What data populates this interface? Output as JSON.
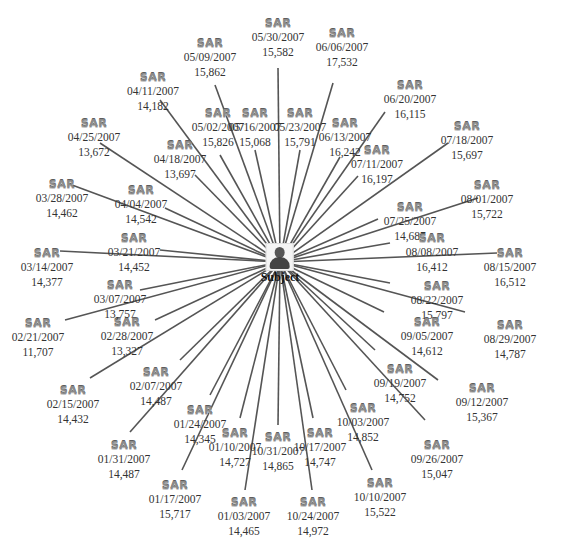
{
  "diagram": {
    "center": {
      "label": "Subject",
      "icon": "person-icon",
      "x": 280,
      "y": 262
    },
    "node_icon_label": "SAR",
    "line_color": "#555555",
    "nodes": [
      {
        "date": "05/30/2007",
        "amount": "15,582",
        "x": 278,
        "y": 18,
        "lx": 278,
        "ly": 68
      },
      {
        "date": "06/06/2007",
        "amount": "17,532",
        "x": 342,
        "y": 28,
        "lx": 333,
        "ly": 83
      },
      {
        "date": "06/20/2007",
        "amount": "16,115",
        "x": 410,
        "y": 80,
        "lx": 385,
        "ly": 112
      },
      {
        "date": "07/18/2007",
        "amount": "15,697",
        "x": 467,
        "y": 121,
        "lx": 448,
        "ly": 143
      },
      {
        "date": "08/01/2007",
        "amount": "15,722",
        "x": 487,
        "y": 180,
        "lx": 478,
        "ly": 198
      },
      {
        "date": "08/15/2007",
        "amount": "16,512",
        "x": 510,
        "y": 248,
        "lx": 497,
        "ly": 253
      },
      {
        "date": "08/29/2007",
        "amount": "14,787",
        "x": 510,
        "y": 320,
        "lx": 465,
        "ly": 312
      },
      {
        "date": "09/12/2007",
        "amount": "15,367",
        "x": 482,
        "y": 383,
        "lx": 438,
        "ly": 380
      },
      {
        "date": "09/26/2007",
        "amount": "15,047",
        "x": 437,
        "y": 440,
        "lx": 425,
        "ly": 420
      },
      {
        "date": "10/10/2007",
        "amount": "15,522",
        "x": 380,
        "y": 478,
        "lx": 372,
        "ly": 470
      },
      {
        "date": "10/24/2007",
        "amount": "14,972",
        "x": 313,
        "y": 497,
        "lx": 312,
        "ly": 490
      },
      {
        "date": "01/03/2007",
        "amount": "14,465",
        "x": 244,
        "y": 497,
        "lx": 245,
        "ly": 490
      },
      {
        "date": "01/17/2007",
        "amount": "15,717",
        "x": 175,
        "y": 480,
        "lx": 182,
        "ly": 470
      },
      {
        "date": "01/31/2007",
        "amount": "14,487",
        "x": 124,
        "y": 440,
        "lx": 130,
        "ly": 432
      },
      {
        "date": "02/15/2007",
        "amount": "14,432",
        "x": 73,
        "y": 385,
        "lx": 90,
        "ly": 378
      },
      {
        "date": "02/21/2007",
        "amount": "11,707",
        "x": 38,
        "y": 318,
        "lx": 65,
        "ly": 320
      },
      {
        "date": "03/14/2007",
        "amount": "14,377",
        "x": 47,
        "y": 248,
        "lx": 60,
        "ly": 251
      },
      {
        "date": "03/28/2007",
        "amount": "14,462",
        "x": 62,
        "y": 179,
        "lx": 72,
        "ly": 185
      },
      {
        "date": "04/25/2007",
        "amount": "13,672",
        "x": 94,
        "y": 118,
        "lx": 100,
        "ly": 143
      },
      {
        "date": "04/11/2007",
        "amount": "14,182",
        "x": 153,
        "y": 72,
        "lx": 160,
        "ly": 100
      },
      {
        "date": "05/09/2007",
        "amount": "15,862",
        "x": 210,
        "y": 38,
        "lx": 215,
        "ly": 85
      },
      {
        "date": "05/16/2007",
        "amount": "15,068",
        "x": 255,
        "y": 108,
        "lx": 255,
        "ly": 150
      },
      {
        "date": "05/23/2007",
        "amount": "15,791",
        "x": 300,
        "y": 108,
        "lx": 300,
        "ly": 150
      },
      {
        "date": "06/13/2007",
        "amount": "16,242",
        "x": 345,
        "y": 118,
        "lx": 340,
        "ly": 157
      },
      {
        "date": "07/11/2007",
        "amount": "16,197",
        "x": 377,
        "y": 145,
        "lx": 358,
        "ly": 176
      },
      {
        "date": "07/25/2007",
        "amount": "14,687",
        "x": 410,
        "y": 202,
        "lx": 378,
        "ly": 219
      },
      {
        "date": "08/08/2007",
        "amount": "16,412",
        "x": 432,
        "y": 233,
        "lx": 390,
        "ly": 243
      },
      {
        "date": "08/22/2007",
        "amount": "15,797",
        "x": 437,
        "y": 281,
        "lx": 390,
        "ly": 283
      },
      {
        "date": "09/05/2007",
        "amount": "14,612",
        "x": 427,
        "y": 317,
        "lx": 384,
        "ly": 312
      },
      {
        "date": "09/19/2007",
        "amount": "14,752",
        "x": 400,
        "y": 364,
        "lx": 375,
        "ly": 350
      },
      {
        "date": "10/03/2007",
        "amount": "14,852",
        "x": 363,
        "y": 403,
        "lx": 346,
        "ly": 390
      },
      {
        "date": "10/17/2007",
        "amount": "14,747",
        "x": 320,
        "y": 428,
        "lx": 313,
        "ly": 418
      },
      {
        "date": "10/31/2007",
        "amount": "14,865",
        "x": 278,
        "y": 432,
        "lx": 278,
        "ly": 425
      },
      {
        "date": "01/10/2007",
        "amount": "14,727",
        "x": 235,
        "y": 428,
        "lx": 240,
        "ly": 418
      },
      {
        "date": "01/24/2007",
        "amount": "14,345",
        "x": 200,
        "y": 405,
        "lx": 210,
        "ly": 395
      },
      {
        "date": "02/07/2007",
        "amount": "14,487",
        "x": 156,
        "y": 367,
        "lx": 180,
        "ly": 360
      },
      {
        "date": "02/28/2007",
        "amount": "13,327",
        "x": 127,
        "y": 317,
        "lx": 155,
        "ly": 320
      },
      {
        "date": "03/07/2007",
        "amount": "13,757",
        "x": 120,
        "y": 280,
        "lx": 140,
        "ly": 290
      },
      {
        "date": "03/21/2007",
        "amount": "14,452",
        "x": 134,
        "y": 233,
        "lx": 160,
        "ly": 250
      },
      {
        "date": "04/04/2007",
        "amount": "14,542",
        "x": 141,
        "y": 185,
        "lx": 165,
        "ly": 208
      },
      {
        "date": "04/18/2007",
        "amount": "13,697",
        "x": 180,
        "y": 140,
        "lx": 195,
        "ly": 175
      },
      {
        "date": "05/02/2007",
        "amount": "15,826",
        "x": 218,
        "y": 108,
        "lx": 220,
        "ly": 155
      }
    ]
  }
}
